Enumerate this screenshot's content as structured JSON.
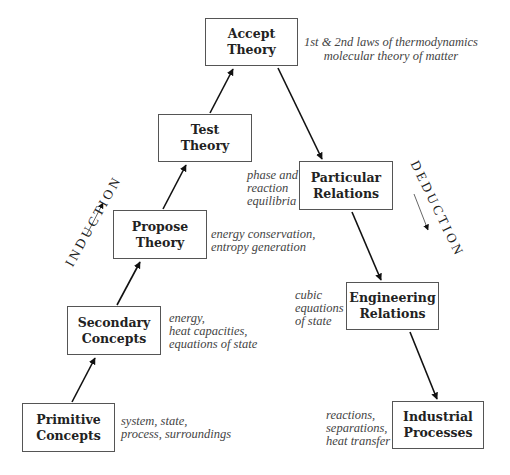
{
  "diagram": {
    "boxes": {
      "accept": {
        "line1": "Accept",
        "line2": "Theory"
      },
      "test": {
        "line1": "Test",
        "line2": "Theory"
      },
      "propose": {
        "line1": "Propose",
        "line2": "Theory"
      },
      "secondary": {
        "line1": "Secondary",
        "line2": "Concepts"
      },
      "primitive": {
        "line1": "Primitive",
        "line2": "Concepts"
      },
      "particular": {
        "line1": "Particular",
        "line2": "Relations"
      },
      "engineering": {
        "line1": "Engineering",
        "line2": "Relations"
      },
      "industrial": {
        "line1": "Industrial",
        "line2": "Processes"
      }
    },
    "notes": {
      "accept": [
        "1st & 2nd laws of thermodynamics",
        "molecular theory of matter"
      ],
      "test": [
        "phase and",
        "reaction",
        "equilibria"
      ],
      "propose": [
        "energy conservation,",
        "entropy generation"
      ],
      "secondary": [
        "energy,",
        "heat capacities,",
        "equations of state"
      ],
      "primitive": [
        "system, state,",
        "process, surroundings"
      ],
      "engineering": [
        "cubic",
        "equations",
        "of state"
      ],
      "industrial": [
        "reactions,",
        "separations,",
        "heat transfer"
      ]
    },
    "side_labels": {
      "induction": "INDUCTION",
      "deduction": "DEDUCTION"
    },
    "colors": {
      "line": "#111111",
      "box_border": "#555555",
      "text": "#222222",
      "note_text": "#444444"
    }
  }
}
